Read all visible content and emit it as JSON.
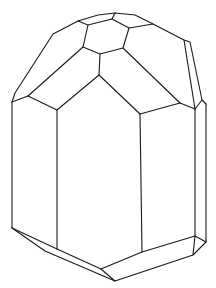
{
  "figure": {
    "background_color": "#ffffff",
    "line_color": "#1a1a1a",
    "vertices": {
      "t1": [
        53,
        34
      ],
      "t2": [
        78,
        21
      ],
      "t3": [
        98,
        15
      ],
      "t4": [
        115,
        13
      ],
      "t5": [
        135,
        15
      ],
      "t6": [
        153,
        24
      ],
      "r1": [
        184,
        40
      ],
      "r2": [
        190,
        42
      ],
      "r3": [
        202,
        100
      ],
      "r4": [
        206,
        104
      ],
      "l1": [
        15,
        93
      ],
      "l2": [
        12,
        102
      ],
      "h1": [
        88,
        25
      ],
      "h2": [
        112,
        19
      ],
      "h3": [
        129,
        28
      ],
      "h4": [
        123,
        48
      ],
      "h5": [
        100,
        54
      ],
      "h6": [
        83,
        47
      ],
      "a": [
        99,
        75
      ],
      "b": [
        28,
        96
      ],
      "c": [
        57,
        110
      ],
      "d": [
        140,
        114
      ],
      "e": [
        180,
        103
      ],
      "f": [
        195,
        109
      ],
      "bl": [
        12,
        228
      ],
      "bc": [
        57,
        249
      ],
      "bd": [
        142,
        252
      ],
      "be": [
        195,
        236
      ],
      "bf": [
        206,
        242
      ],
      "bg": [
        193,
        255
      ],
      "bot": [
        115,
        281
      ],
      "bh": [
        101,
        269
      ],
      "bi": [
        45,
        251
      ]
    }
  }
}
